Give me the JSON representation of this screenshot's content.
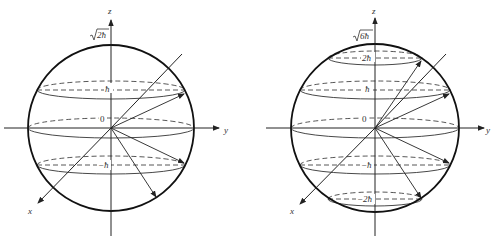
{
  "figure": {
    "left": {
      "name": "l=1 angular momentum sphere",
      "axis_labels": {
        "z": "z",
        "y": "y",
        "x": "x"
      },
      "radius_label": "√2ħ",
      "radius_label_root": "2ħ",
      "levels": [
        {
          "label": "ħ",
          "y": 90,
          "rx": 74
        },
        {
          "label": "0",
          "y": 128,
          "rx": 83
        },
        {
          "label": "−ħ",
          "y": 165,
          "rx": 74
        }
      ]
    },
    "right": {
      "name": "l=2 angular momentum sphere",
      "axis_labels": {
        "z": "z",
        "y": "y",
        "x": "x"
      },
      "radius_label": "√6ħ",
      "radius_label_root": "6ħ",
      "levels": [
        {
          "label": "2ħ",
          "y": 58,
          "rx": 47
        },
        {
          "label": "ħ",
          "y": 90,
          "rx": 75
        },
        {
          "label": "0",
          "y": 128,
          "rx": 84
        },
        {
          "label": "−ħ",
          "y": 165,
          "rx": 75
        },
        {
          "label": "−2ħ",
          "y": 199,
          "rx": 47
        }
      ]
    },
    "colors": {
      "stroke": "#222222",
      "background": "#ffffff"
    }
  }
}
